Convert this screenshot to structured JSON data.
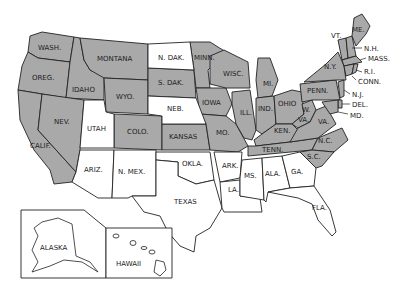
{
  "map": {
    "title": "United States",
    "colors": {
      "shaded": "#a9a9a9",
      "unshaded": "#ffffff",
      "border": "#222222"
    },
    "states": [
      {
        "label": "WASH.",
        "shaded": true
      },
      {
        "label": "OREG.",
        "shaded": true
      },
      {
        "label": "CALIF.",
        "shaded": true
      },
      {
        "label": "IDAHO",
        "shaded": true
      },
      {
        "label": "NEV.",
        "shaded": true
      },
      {
        "label": "MONTANA",
        "shaded": true
      },
      {
        "label": "WYO.",
        "shaded": true
      },
      {
        "label": "UTAH",
        "shaded": false
      },
      {
        "label": "COLO.",
        "shaded": true
      },
      {
        "label": "ARIZ.",
        "shaded": false
      },
      {
        "label": "N. MEX.",
        "shaded": false
      },
      {
        "label": "N. DAK.",
        "shaded": false
      },
      {
        "label": "S. DAK.",
        "shaded": true
      },
      {
        "label": "NEB.",
        "shaded": false
      },
      {
        "label": "KANSAS",
        "shaded": true
      },
      {
        "label": "OKLA.",
        "shaded": false
      },
      {
        "label": "TEXAS",
        "shaded": false
      },
      {
        "label": "MINN.",
        "shaded": true
      },
      {
        "label": "IOWA",
        "shaded": true
      },
      {
        "label": "MO.",
        "shaded": true
      },
      {
        "label": "ARK.",
        "shaded": false
      },
      {
        "label": "LA.",
        "shaded": false
      },
      {
        "label": "WISC.",
        "shaded": true
      },
      {
        "label": "ILL.",
        "shaded": true
      },
      {
        "label": "MI.",
        "shaded": true
      },
      {
        "label": "IND.",
        "shaded": true
      },
      {
        "label": "OHIO",
        "shaded": true
      },
      {
        "label": "KEN.",
        "shaded": true
      },
      {
        "label": "TENN.",
        "shaded": true
      },
      {
        "label": "MS.",
        "shaded": false
      },
      {
        "label": "ALA.",
        "shaded": false
      },
      {
        "label": "GA.",
        "shaded": false
      },
      {
        "label": "FLA.",
        "shaded": false
      },
      {
        "label": "S.C.",
        "shaded": true
      },
      {
        "label": "N.C.",
        "shaded": true
      },
      {
        "label": "VA.",
        "shaded": true
      },
      {
        "label": "W. VA.",
        "shaded": true
      },
      {
        "label": "PENN.",
        "shaded": true
      },
      {
        "label": "N.Y.",
        "shaded": true
      },
      {
        "label": "VT.",
        "shaded": true
      },
      {
        "label": "N.H.",
        "shaded": true
      },
      {
        "label": "ME.",
        "shaded": true
      },
      {
        "label": "MASS.",
        "shaded": true
      },
      {
        "label": "R.I.",
        "shaded": true
      },
      {
        "label": "CONN.",
        "shaded": true
      },
      {
        "label": "N.J.",
        "shaded": true
      },
      {
        "label": "DEL.",
        "shaded": true
      },
      {
        "label": "MD.",
        "shaded": true
      },
      {
        "label": "ALASKA",
        "shaded": false
      },
      {
        "label": "HAWAII",
        "shaded": false
      }
    ],
    "labels": {
      "wash": "WASH.",
      "oreg": "OREG.",
      "calif": "CALIF.",
      "idaho": "IDAHO",
      "nev": "NEV.",
      "montana": "MONTANA",
      "wyo": "WYO.",
      "utah": "UTAH",
      "colo": "COLO.",
      "ariz": "ARIZ.",
      "nmex": "N. MEX.",
      "ndak": "N. DAK.",
      "sdak": "S. DAK.",
      "neb": "NEB.",
      "kansas": "KANSAS",
      "okla": "OKLA.",
      "texas": "TEXAS",
      "minn": "MINN.",
      "iowa": "IOWA",
      "mo": "MO.",
      "ark": "ARK.",
      "la": "LA.",
      "wisc": "WISC.",
      "ill": "ILL.",
      "mi": "MI.",
      "ind": "IND.",
      "ohio": "OHIO",
      "ken": "KEN.",
      "tenn": "TENN.",
      "ms": "MS.",
      "ala": "ALA.",
      "ga": "GA.",
      "fla": "FLA.",
      "sc": "S.C.",
      "nc": "N.C.",
      "va": "VA.",
      "wva_w": "W.",
      "wva_va": "VA.",
      "penn": "PENN.",
      "ny": "N.Y.",
      "vt": "VT.",
      "nh": "N.H.",
      "me": "ME.",
      "mass": "MASS.",
      "ri": "R.I.",
      "conn": "CONN.",
      "nj": "N.J.",
      "del": "DEL.",
      "md": "MD.",
      "alaska": "ALASKA",
      "hawaii": "HAWAII"
    }
  }
}
